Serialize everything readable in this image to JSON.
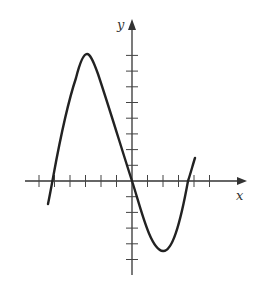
{
  "chart_data": {
    "type": "line",
    "title": "",
    "xlabel": "x",
    "ylabel": "y",
    "grid": false,
    "tick_labels": "none",
    "x_ticks": [
      -6,
      -5,
      -4,
      -3,
      -2,
      -1,
      1,
      2,
      3,
      4,
      5
    ],
    "y_ticks": [
      -5,
      -4,
      -3,
      -2,
      -1,
      1,
      2,
      3,
      4,
      5,
      6,
      7,
      8
    ],
    "xlim": [
      -7,
      7.5
    ],
    "ylim": [
      -6,
      10
    ],
    "series": [
      {
        "name": "curve",
        "x": [
          -5.5,
          -5.1,
          -3.0,
          0,
          2.0,
          3.6,
          4.1
        ],
        "y": [
          -1.5,
          0,
          8.2,
          0,
          -4.4,
          0,
          1.5
        ],
        "notes": "local max near (-3, 8.2); local min near (2, -4.4); passes through origin"
      }
    ],
    "colors": {
      "curve": "#222222",
      "axes": "#333333",
      "background": "#ffffff"
    }
  },
  "labels": {
    "x_axis": "x",
    "y_axis": "y"
  }
}
